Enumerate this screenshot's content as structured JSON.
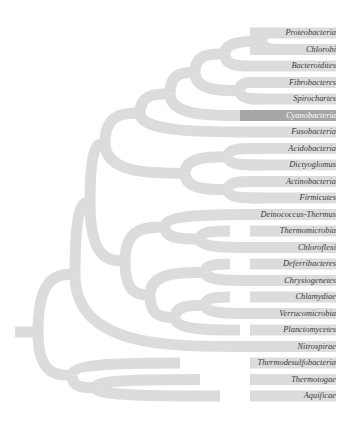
{
  "diagram": {
    "type": "phylogenetic-tree",
    "branch_color": "#dcdcdc",
    "highlight_color": "#a6a6a6",
    "highlighted_taxon": "Cyanobacteria",
    "taxa": [
      {
        "name": "Proteobacteria"
      },
      {
        "name": "Chlorobi"
      },
      {
        "name": "Bacteroidites"
      },
      {
        "name": "Fibrobacteres"
      },
      {
        "name": "Spirochartes"
      },
      {
        "name": "Cyanobacteria",
        "highlighted": true
      },
      {
        "name": "Fusobacteria"
      },
      {
        "name": "Acidobacteria"
      },
      {
        "name": "Dictyoglomus"
      },
      {
        "name": "Actinobacteria"
      },
      {
        "name": "Firmicutes"
      },
      {
        "name": "Deinococcus-Thermus"
      },
      {
        "name": "Thermomicrobia"
      },
      {
        "name": "Chloroflexi"
      },
      {
        "name": "Deferribacteres"
      },
      {
        "name": "Chrysiogenetes"
      },
      {
        "name": "Chlamydiae"
      },
      {
        "name": "Verrucomicrobia"
      },
      {
        "name": "Planctomycetes"
      },
      {
        "name": "Nitrospirae"
      },
      {
        "name": "Thermodesulfobacteria"
      },
      {
        "name": "Thermotogae"
      },
      {
        "name": "Aquificae"
      }
    ]
  }
}
